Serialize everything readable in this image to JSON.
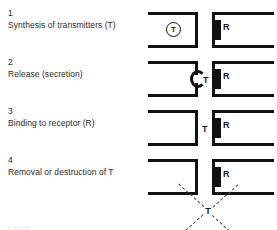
{
  "figure": {
    "bottom_caption": "Figure",
    "labels": {
      "transmitter": "T",
      "receptor": "R"
    }
  },
  "steps": [
    {
      "number": "1",
      "text": "Synthesis of transmitters (T)",
      "presynaptic": {
        "shape": "terminal-closed",
        "vesicle_label": "T",
        "has_vesicle": true,
        "has_notch": false
      },
      "postsynaptic": {
        "receptor_label": "R",
        "has_receptor": true
      },
      "free_transmitter": null,
      "bound_transmitter": null,
      "degradation": false
    },
    {
      "number": "2",
      "text": "Release (secretion)",
      "presynaptic": {
        "shape": "terminal-notched",
        "vesicle_label": "T",
        "has_vesicle": false,
        "has_notch": true
      },
      "postsynaptic": {
        "receptor_label": "R",
        "has_receptor": true
      },
      "free_transmitter": "T",
      "bound_transmitter": null,
      "degradation": false
    },
    {
      "number": "3",
      "text": "Binding to receptor (R)",
      "presynaptic": {
        "shape": "terminal-closed",
        "vesicle_label": "T",
        "has_vesicle": false,
        "has_notch": false
      },
      "postsynaptic": {
        "receptor_label": "R",
        "has_receptor": true
      },
      "free_transmitter": null,
      "bound_transmitter": "T",
      "degradation": false
    },
    {
      "number": "4",
      "text": "Removal or destruction of T",
      "presynaptic": {
        "shape": "terminal-closed",
        "vesicle_label": "T",
        "has_vesicle": false,
        "has_notch": false
      },
      "postsynaptic": {
        "receptor_label": "R",
        "has_receptor": true
      },
      "free_transmitter": null,
      "bound_transmitter": null,
      "degradation": true,
      "degradation_label": "T"
    }
  ],
  "colors": {
    "ink": "#111111",
    "text": "#2b2b2b",
    "dashed": "#4a4a4a",
    "background": "#ffffff"
  }
}
